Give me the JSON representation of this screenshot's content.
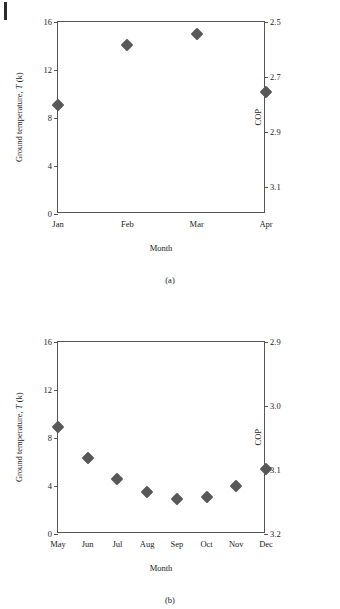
{
  "page": {
    "background": "#ffffff",
    "marker_color": "#585858",
    "axis_color": "#555555",
    "text_color": "#1a1a1a"
  },
  "chart_data": [
    {
      "id": "a",
      "type": "scatter",
      "title": "",
      "caption": "(a)",
      "xlabel": "Month",
      "ylabel": "Ground temperature, T (k)",
      "ylabel_prefix": "Ground temperature, ",
      "ylabel_symbol": "T",
      "ylabel_suffix": " (k)",
      "y2label": "COP",
      "categories": [
        "Jan",
        "Feb",
        "Mar",
        "Apr"
      ],
      "values": [
        9.1,
        14.1,
        15.0,
        10.2
      ],
      "ylim": [
        0,
        16
      ],
      "yticks": [
        "0",
        "4",
        "8",
        "12",
        "16"
      ],
      "ytick_values": [
        0,
        4,
        8,
        12,
        16
      ],
      "y2lim": [
        2.5,
        3.2
      ],
      "y2_inverted": true,
      "y2ticks": [
        "2.5",
        "2.7",
        "2.9",
        "3.1"
      ],
      "y2tick_values": [
        2.5,
        2.7,
        2.9,
        3.1
      ],
      "cop_values": [
        3.02,
        2.68,
        2.62,
        2.96
      ],
      "grid": false,
      "legend": "none"
    },
    {
      "id": "b",
      "type": "scatter",
      "title": "",
      "caption": "(b)",
      "xlabel": "Month",
      "ylabel": "Ground temperature, T (k)",
      "ylabel_prefix": "Ground temperature, ",
      "ylabel_symbol": "T",
      "ylabel_suffix": " (k)",
      "y2label": "COP",
      "categories": [
        "May",
        "Jun",
        "Jul",
        "Aug",
        "Sep",
        "Oct",
        "Nov",
        "Dec"
      ],
      "values": [
        8.9,
        6.3,
        4.6,
        3.5,
        2.9,
        3.1,
        4.0,
        5.4
      ],
      "ylim": [
        0,
        16
      ],
      "yticks": [
        "0",
        "4",
        "8",
        "12",
        "16"
      ],
      "ytick_values": [
        0,
        4,
        8,
        12,
        16
      ],
      "y2lim": [
        2.9,
        3.2
      ],
      "y2_inverted": true,
      "y2ticks": [
        "3.2",
        "3.1",
        "3.0",
        "2.9"
      ],
      "y2tick_values": [
        3.2,
        3.1,
        3.0,
        2.9
      ],
      "cop_values": [
        2.99,
        3.03,
        3.06,
        3.08,
        3.09,
        3.08,
        3.07,
        3.0
      ],
      "grid": false,
      "legend": "none"
    }
  ]
}
